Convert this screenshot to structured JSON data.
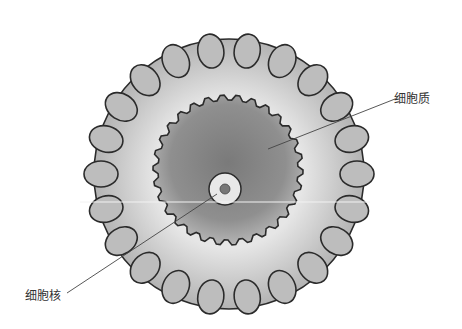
{
  "diagram": {
    "labels": [
      {
        "id": "cytoplasm",
        "text": "细胞质"
      },
      {
        "id": "nucleus",
        "text": "细胞核"
      }
    ],
    "colors": {
      "outline": "#2b2b2b",
      "lobes": "#b8b8b8",
      "cytoplasm_center": "#7a7a7a",
      "cytoplasm_edge": "#a9a9a9",
      "leader_line": "#444444"
    }
  }
}
